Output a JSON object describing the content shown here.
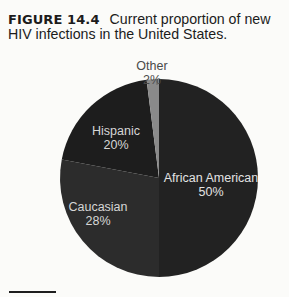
{
  "caption": {
    "figure_label": "FIGURE 14.4",
    "text": "Current proportion of new HIV infections in the United States."
  },
  "chart_data": {
    "type": "pie",
    "title": "Current proportion of new HIV infections in the United States.",
    "categories": [
      "African American",
      "Caucasian",
      "Hispanic",
      "Other"
    ],
    "values": [
      50,
      28,
      20,
      2
    ],
    "unit": "%",
    "start_angle_deg": 0,
    "direction": "clockwise",
    "colors": {
      "African American": "#222222",
      "Caucasian": "#2c2c2c",
      "Hispanic": "#1d1d1d",
      "Other": "#8a8a8a"
    },
    "labels": [
      {
        "name": "African American",
        "value": "50%",
        "color": "#e2e2e2"
      },
      {
        "name": "Caucasian",
        "value": "28%",
        "color": "#d6d6d6"
      },
      {
        "name": "Hispanic",
        "value": "20%",
        "color": "#d6d6d6"
      },
      {
        "name": "Other",
        "value": "2%",
        "color": "#4a4a4a"
      }
    ],
    "legend": "none (direct labels)"
  }
}
